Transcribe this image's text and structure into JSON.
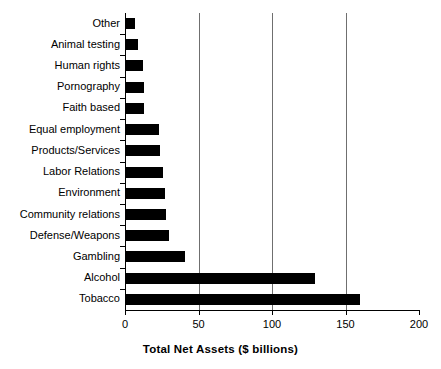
{
  "chart_data": {
    "type": "bar",
    "orientation": "horizontal",
    "title": "",
    "xlabel": "Total Net Assets ($ billions)",
    "ylabel": "",
    "xlim": [
      0,
      200
    ],
    "xticks": [
      0,
      50,
      100,
      150,
      200
    ],
    "xtick_labels": [
      "0",
      "50",
      "100",
      "150",
      "200"
    ],
    "gridlines": [
      50,
      100,
      150
    ],
    "grid": true,
    "legend": null,
    "bar_color": "#000000",
    "axis_color": "#000000",
    "gridline_color": "#6f6f6f",
    "categories": [
      "Other",
      "Animal testing",
      "Human rights",
      "Pornography",
      "Faith based",
      "Equal employment",
      "Products/Services",
      "Labor Relations",
      "Environment",
      "Community relations",
      "Defense/Weapons",
      "Gambling",
      "Alcohol",
      "Tobacco"
    ],
    "values": [
      7,
      9,
      12,
      13,
      13,
      23,
      24,
      26,
      27,
      28,
      30,
      41,
      129,
      160
    ]
  }
}
